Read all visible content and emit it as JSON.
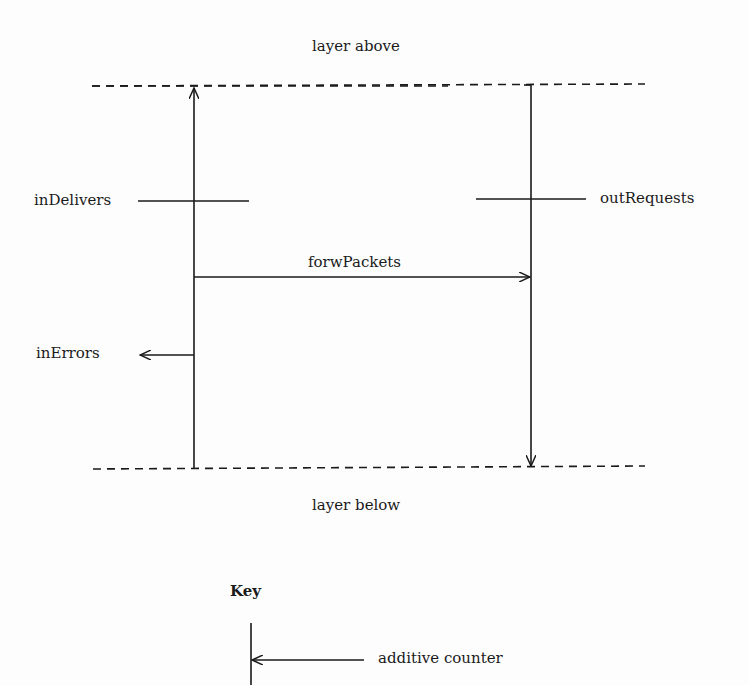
{
  "diagram": {
    "top_label": "layer above",
    "bottom_label": "layer below",
    "counters": {
      "in_delivers": "inDelivers",
      "out_requests": "outRequests",
      "forw_packets": "forwPackets",
      "in_errors": "inErrors"
    },
    "key": {
      "title": "Key",
      "additive_counter": "additive counter"
    },
    "colors": {
      "line": "#1a1a1a",
      "background": "#fdfdfd"
    }
  }
}
